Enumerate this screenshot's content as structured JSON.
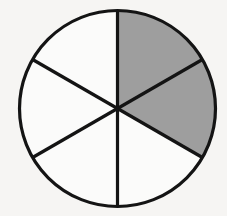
{
  "figure": {
    "background_color": "#f6f5f3",
    "outline_color": "#141414",
    "shaded_color": "#9e9e9e",
    "unshaded_color": "#fbfbfa"
  },
  "chart_data": {
    "type": "pie",
    "title": "",
    "subtitle": "",
    "xlabel": "",
    "ylabel": "",
    "legend_position": "none",
    "grid": false,
    "center_x": 117.5,
    "center_y": 108.5,
    "radius": 98,
    "total_slices": 6,
    "shaded_slices": 2,
    "fraction_label": "2/6",
    "simplified_fraction": "1/3",
    "fraction_value": 0.3333,
    "percent_shaded": 33.3,
    "slice_angle_degrees": 60,
    "categories": [
      "sector-1-top-right",
      "sector-2-right",
      "sector-3-bottom-right",
      "sector-4-bottom-left",
      "sector-5-left",
      "sector-6-top-left"
    ],
    "values": [
      1,
      1,
      1,
      1,
      1,
      1
    ],
    "series": [
      {
        "name": "shaded",
        "values": [
          1,
          1,
          0,
          0,
          0,
          0
        ]
      }
    ],
    "slices": [
      {
        "name": "sector-1-top-right",
        "start_deg": 90,
        "end_deg": 30,
        "shaded": true,
        "color": "#9e9e9e"
      },
      {
        "name": "sector-2-right",
        "start_deg": 30,
        "end_deg": -30,
        "shaded": true,
        "color": "#9e9e9e"
      },
      {
        "name": "sector-3-bottom-right",
        "start_deg": -30,
        "end_deg": -90,
        "shaded": false,
        "color": "#fbfbfa"
      },
      {
        "name": "sector-4-bottom-left",
        "start_deg": -90,
        "end_deg": -150,
        "shaded": false,
        "color": "#fbfbfa"
      },
      {
        "name": "sector-5-left",
        "start_deg": 210,
        "end_deg": 150,
        "shaded": false,
        "color": "#fbfbfa"
      },
      {
        "name": "sector-6-top-left",
        "start_deg": 150,
        "end_deg": 90,
        "shaded": false,
        "color": "#fbfbfa"
      }
    ],
    "dividers": [
      {
        "name": "divider-vertical",
        "x1": 117.5,
        "y1": 10.5,
        "x2": 117.5,
        "y2": 206.5
      },
      {
        "name": "divider-diagonal-a",
        "x1": 32.6,
        "y1": 59.5,
        "x2": 202.4,
        "y2": 157.5
      },
      {
        "name": "divider-diagonal-b",
        "x1": 32.6,
        "y1": 157.5,
        "x2": 202.4,
        "y2": 59.5
      }
    ]
  }
}
